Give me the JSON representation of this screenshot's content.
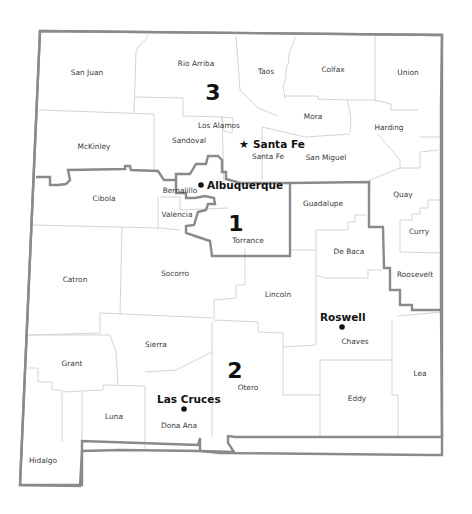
{
  "map": {
    "title": "New Mexico Congressional Districts",
    "colors": {
      "background": "#ffffff",
      "district_border": "#8a8a8a",
      "county_border": "#d4d4d4",
      "text": "#111111"
    },
    "districts": [
      {
        "number": "1",
        "x": 236,
        "y": 231
      },
      {
        "number": "2",
        "x": 235,
        "y": 378
      },
      {
        "number": "3",
        "x": 213,
        "y": 100
      }
    ],
    "counties": [
      {
        "name": "San Juan",
        "x": 87,
        "y": 75
      },
      {
        "name": "Rio Arriba",
        "x": 196,
        "y": 66
      },
      {
        "name": "Taos",
        "x": 266,
        "y": 74
      },
      {
        "name": "Colfax",
        "x": 333,
        "y": 72
      },
      {
        "name": "Union",
        "x": 408,
        "y": 75
      },
      {
        "name": "Los Alamos",
        "x": 219,
        "y": 128
      },
      {
        "name": "Mora",
        "x": 313,
        "y": 119
      },
      {
        "name": "Harding",
        "x": 389,
        "y": 130
      },
      {
        "name": "McKinley",
        "x": 94,
        "y": 149
      },
      {
        "name": "Sandoval",
        "x": 189,
        "y": 143
      },
      {
        "name": "Santa Fe",
        "x": 268,
        "y": 159
      },
      {
        "name": "San Miguel",
        "x": 326,
        "y": 160
      },
      {
        "name": "Bernalillo",
        "x": 180,
        "y": 193
      },
      {
        "name": "Cibola",
        "x": 104,
        "y": 201
      },
      {
        "name": "Guadalupe",
        "x": 323,
        "y": 206
      },
      {
        "name": "Quay",
        "x": 403,
        "y": 197
      },
      {
        "name": "Valencia",
        "x": 177,
        "y": 217
      },
      {
        "name": "Torrance",
        "x": 248,
        "y": 243
      },
      {
        "name": "De Baca",
        "x": 349,
        "y": 254
      },
      {
        "name": "Curry",
        "x": 419,
        "y": 234
      },
      {
        "name": "Catron",
        "x": 75,
        "y": 282
      },
      {
        "name": "Socorro",
        "x": 175,
        "y": 276
      },
      {
        "name": "Roosevelt",
        "x": 415,
        "y": 277
      },
      {
        "name": "Lincoln",
        "x": 278,
        "y": 297
      },
      {
        "name": "Chaves",
        "x": 355,
        "y": 344
      },
      {
        "name": "Sierra",
        "x": 156,
        "y": 347
      },
      {
        "name": "Grant",
        "x": 72,
        "y": 366
      },
      {
        "name": "Lea",
        "x": 420,
        "y": 376
      },
      {
        "name": "Otero",
        "x": 248,
        "y": 390
      },
      {
        "name": "Eddy",
        "x": 357,
        "y": 401
      },
      {
        "name": "Luna",
        "x": 114,
        "y": 419
      },
      {
        "name": "Dona Ana",
        "x": 179,
        "y": 428
      },
      {
        "name": "Hidalgo",
        "x": 43,
        "y": 463
      }
    ],
    "cities": [
      {
        "name": "Santa Fe",
        "marker": "star",
        "marker_glyph": "★",
        "mx": 244,
        "my": 143,
        "lx": 253,
        "ly": 147
      },
      {
        "name": "Albuquerque",
        "marker": "dot",
        "marker_glyph": "●",
        "mx": 201,
        "my": 185,
        "lx": 207,
        "ly": 189
      },
      {
        "name": "Roswell",
        "marker": "dot",
        "marker_glyph": "●",
        "mx": 342,
        "my": 326,
        "lx": 320,
        "ly": 320
      },
      {
        "name": "Las Cruces",
        "marker": "dot",
        "marker_glyph": "●",
        "mx": 184,
        "my": 409,
        "lx": 157,
        "ly": 402
      }
    ]
  }
}
